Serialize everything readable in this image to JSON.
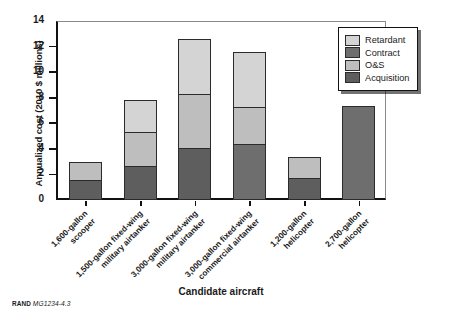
{
  "footer": {
    "org": "RAND",
    "figure_id": "MG1234-4.3"
  },
  "legend": {
    "position": "top-right",
    "items": [
      {
        "label": "Retardant",
        "color": "#d4d4d4"
      },
      {
        "label": "Contract",
        "color": "#6e6e6e"
      },
      {
        "label": "O&S",
        "color": "#bebebe"
      },
      {
        "label": "Acquisition",
        "color": "#5e5e5e"
      }
    ]
  },
  "chart_data": {
    "type": "bar",
    "subtype": "stacked-vertical",
    "title": "",
    "xlabel": "Candidate aircraft",
    "ylabel": "Annualized cost (2010 $ millions)",
    "ylim": [
      0,
      14
    ],
    "yticks": [
      0,
      2,
      4,
      6,
      8,
      10,
      12,
      14
    ],
    "ytick_labels": [
      "0",
      "2",
      "4",
      "6",
      "8",
      "10",
      "12",
      "14"
    ],
    "grid": false,
    "legend_position": "top-right",
    "categories": [
      "1,600-gallon\nscooper",
      "1,500-gallon fixed-wing\nmilitary airtanker",
      "3,000-gallon fixed-wing\nmilitary airtanker",
      "3,000-gallon fixed-wing\ncommercial airtanker",
      "1,200-gallon\nhelicopter",
      "2,700-gallon\nhelicopter"
    ],
    "category_lines": [
      [
        "1,600-gallon",
        "scooper"
      ],
      [
        "1,500-gallon fixed-wing",
        "military airtanker"
      ],
      [
        "3,000-gallon fixed-wing",
        "military airtanker"
      ],
      [
        "3,000-gallon fixed-wing",
        "commercial airtanker"
      ],
      [
        "1,200-gallon",
        "helicopter"
      ],
      [
        "2,700-gallon",
        "helicopter"
      ]
    ],
    "series": [
      {
        "name": "Acquisition",
        "color": "#5e5e5e",
        "values": [
          1.6,
          2.65,
          4.1,
          0,
          1.7,
          0
        ]
      },
      {
        "name": "Contract",
        "color": "#6e6e6e",
        "values": [
          0,
          0,
          0,
          4.4,
          0,
          7.35
        ]
      },
      {
        "name": "O&S",
        "color": "#bebebe",
        "values": [
          1.35,
          2.7,
          4.2,
          2.85,
          1.7,
          0
        ]
      },
      {
        "name": "Retardant",
        "color": "#d4d4d4",
        "values": [
          0,
          2.5,
          4.3,
          4.3,
          0,
          0
        ]
      }
    ],
    "totals": [
      2.95,
      7.85,
      12.6,
      11.55,
      3.4,
      7.35
    ]
  }
}
